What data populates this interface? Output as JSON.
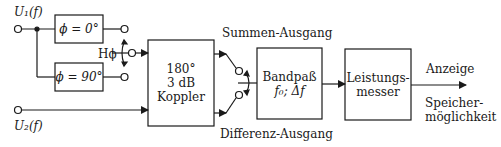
{
  "inputs": {
    "u1": "U₁(f)",
    "u2": "U₂(f)"
  },
  "blocks": {
    "phase0": "ϕ = 0°",
    "phase90": "ϕ = 90°",
    "coupler": [
      "180°",
      "3 dB",
      "Koppler"
    ],
    "bandpass": [
      "Bandpaß",
      "f₀; Δf"
    ],
    "powermeter": [
      "Leistungs-",
      "messer"
    ]
  },
  "switches": {
    "phase_switch_label": "Hϕ"
  },
  "outputs": {
    "sum": "Summen-Ausgang",
    "diff": "Differenz-Ausgang",
    "display": "Anzeige",
    "storage": [
      "Speicher-",
      "möglichkeit"
    ]
  }
}
